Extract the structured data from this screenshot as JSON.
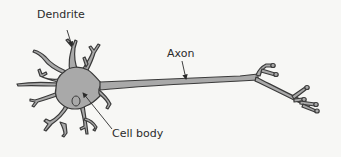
{
  "diagram": {
    "type": "labeled-illustration",
    "labels": {
      "dendrite": "Dendrite",
      "axon": "Axon",
      "cell_body": "Cell body"
    },
    "colors": {
      "cell_fill": "#a9a9a9",
      "outline": "#3a3a3a",
      "background": "#f7f7f5",
      "text": "#2b2b2b"
    }
  }
}
